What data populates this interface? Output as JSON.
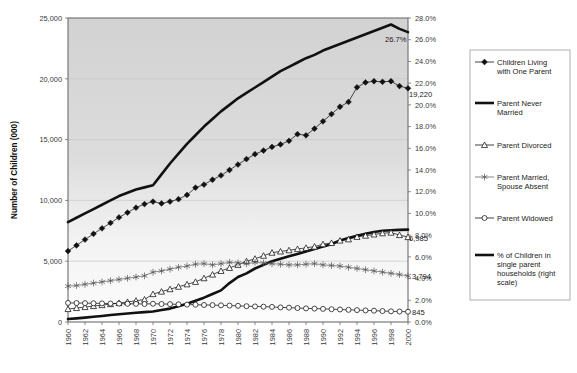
{
  "chart_data": {
    "type": "line",
    "title": "",
    "subtitle": "",
    "xlabel": "",
    "ylabel": "Number of Children (000)",
    "y2label": "",
    "grid": true,
    "legend_position": "right-outside",
    "xlim": [
      1960,
      2000
    ],
    "ylim": [
      0,
      25000
    ],
    "y2lim": [
      0,
      28
    ],
    "ytick_labels": [
      "25,000",
      "20,000",
      "15,000",
      "10,000",
      "5,000",
      "0"
    ],
    "ytick_values": [
      25000,
      20000,
      15000,
      10000,
      5000,
      0
    ],
    "y2tick_labels": [
      "28.0%",
      "26.0%",
      "24.0%",
      "22.0%",
      "20.0%",
      "18.0%",
      "16.0%",
      "14.0%",
      "12.0%",
      "10.0%",
      "8.0%",
      "6.0%",
      "4.0%",
      "2.0%",
      "0.0%"
    ],
    "y2tick_values": [
      28,
      26,
      24,
      22,
      20,
      18,
      16,
      14,
      12,
      10,
      8,
      6,
      4,
      2,
      0
    ],
    "xtick_labels": [
      "1960",
      "1962",
      "1964",
      "1966",
      "1968",
      "1970",
      "1972",
      "1974",
      "1976",
      "1978",
      "1980",
      "1982",
      "1984",
      "1986",
      "1988",
      "1990",
      "1992",
      "1994",
      "1996",
      "1998",
      "2000"
    ],
    "xtick_values": [
      1960,
      1962,
      1964,
      1966,
      1968,
      1970,
      1972,
      1974,
      1976,
      1978,
      1980,
      1982,
      1984,
      1986,
      1988,
      1990,
      1992,
      1994,
      1996,
      1998,
      2000
    ],
    "x": [
      1960,
      1961,
      1962,
      1963,
      1964,
      1965,
      1966,
      1967,
      1968,
      1969,
      1970,
      1971,
      1972,
      1973,
      1974,
      1975,
      1976,
      1977,
      1978,
      1979,
      1980,
      1981,
      1982,
      1983,
      1984,
      1985,
      1986,
      1987,
      1988,
      1989,
      1990,
      1991,
      1992,
      1993,
      1994,
      1995,
      1996,
      1997,
      1998,
      1999,
      2000
    ],
    "series": [
      {
        "name": "Children Living with One Parent",
        "axis": "left",
        "marker": "diamond-filled",
        "end_label": "19,220",
        "values": [
          5829,
          6300,
          6780,
          7250,
          7700,
          8150,
          8600,
          9000,
          9400,
          9700,
          9900,
          9750,
          9900,
          10100,
          10450,
          11050,
          11300,
          11700,
          12050,
          12500,
          12950,
          13400,
          13800,
          14100,
          14400,
          14600,
          14900,
          15450,
          15350,
          15900,
          16500,
          17100,
          17700,
          18100,
          19300,
          19700,
          19800,
          19750,
          19800,
          19400,
          19220
        ]
      },
      {
        "name": "Parent Never Married",
        "axis": "left",
        "marker": "none",
        "end_label": "",
        "values": [
          243,
          300,
          360,
          430,
          500,
          570,
          640,
          700,
          760,
          810,
          860,
          980,
          1100,
          1300,
          1500,
          1750,
          2000,
          2300,
          2600,
          3200,
          3700,
          4000,
          4400,
          4700,
          5000,
          5200,
          5400,
          5600,
          5800,
          6000,
          6200,
          6400,
          6700,
          6900,
          7100,
          7250,
          7400,
          7500,
          7550,
          7580,
          7597
        ]
      },
      {
        "name": "Parent Divorced",
        "axis": "left",
        "marker": "triangle-open",
        "end_label": "6,985",
        "values": [
          1066,
          1150,
          1230,
          1310,
          1390,
          1470,
          1560,
          1650,
          1750,
          1850,
          2296,
          2500,
          2700,
          2900,
          3100,
          3300,
          3600,
          3900,
          4200,
          4450,
          4700,
          5000,
          5200,
          5450,
          5700,
          5800,
          5900,
          6000,
          6100,
          6200,
          6400,
          6500,
          6700,
          6800,
          7000,
          7100,
          7200,
          7300,
          7350,
          7150,
          6985
        ]
      },
      {
        "name": "Parent Married, Spouse Absent",
        "axis": "left",
        "marker": "star-open",
        "end_label": "3,794",
        "values": [
          2951,
          3000,
          3100,
          3200,
          3300,
          3400,
          3500,
          3600,
          3700,
          3800,
          4100,
          4200,
          4350,
          4500,
          4600,
          4750,
          4800,
          4700,
          4800,
          4900,
          4850,
          4800,
          4900,
          4850,
          4800,
          4750,
          4700,
          4700,
          4750,
          4800,
          4700,
          4650,
          4600,
          4500,
          4400,
          4300,
          4200,
          4100,
          4000,
          3900,
          3794
        ]
      },
      {
        "name": "Parent Widowed",
        "axis": "left",
        "marker": "circle-open",
        "end_label": "845",
        "values": [
          1569,
          1560,
          1550,
          1540,
          1530,
          1520,
          1510,
          1500,
          1490,
          1480,
          1500,
          1480,
          1470,
          1450,
          1430,
          1420,
          1400,
          1390,
          1370,
          1350,
          1330,
          1300,
          1280,
          1260,
          1240,
          1200,
          1180,
          1150,
          1120,
          1100,
          1080,
          1050,
          1030,
          1000,
          980,
          950,
          930,
          900,
          880,
          860,
          845
        ]
      },
      {
        "name": "% of Children in single parent households (right scale)",
        "axis": "right",
        "marker": "none",
        "end_label": "26.7%",
        "values": [
          9.2,
          9.6,
          10.0,
          10.4,
          10.8,
          11.2,
          11.6,
          11.9,
          12.2,
          12.4,
          12.6,
          13.6,
          14.6,
          15.5,
          16.4,
          17.2,
          18.0,
          18.7,
          19.4,
          20.0,
          20.6,
          21.1,
          21.6,
          22.1,
          22.6,
          23.1,
          23.5,
          23.9,
          24.3,
          24.6,
          25.0,
          25.3,
          25.6,
          25.9,
          26.2,
          26.5,
          26.8,
          27.1,
          27.4,
          27.0,
          26.7
        ]
      }
    ],
    "data_labels": [
      {
        "text": "26.7%",
        "series": "% of Children in single parent households (right scale)"
      },
      {
        "text": "19,220",
        "series": "Children Living with One Parent"
      },
      {
        "text": "7,597",
        "series": "Parent Never Married"
      },
      {
        "text": "6,985",
        "series": "Parent Divorced"
      },
      {
        "text": "3,794",
        "series": "Parent Married, Spouse Absent"
      },
      {
        "text": "845",
        "series": "Parent Widowed"
      }
    ]
  },
  "legend": {
    "items": [
      {
        "label_line1": "Children Living",
        "label_line2": "with One Parent",
        "marker": "diamond-filled"
      },
      {
        "label_line1": "Parent Never",
        "label_line2": "Married",
        "marker": "thick-line"
      },
      {
        "label_line1": "Parent Divorced",
        "label_line2": "",
        "marker": "triangle-open"
      },
      {
        "label_line1": "Parent Married,",
        "label_line2": "Spouse Absent",
        "marker": "star-open"
      },
      {
        "label_line1": "Parent Widowed",
        "label_line2": "",
        "marker": "circle-open"
      },
      {
        "label_line1": "% of Children in",
        "label_line2": "single parent",
        "label_line3": "households (right",
        "label_line4": "scale)",
        "marker": "thick-line"
      }
    ]
  },
  "colors": {
    "line": "#111111",
    "grid": "#c9c9c9",
    "border": "#6e6e6e",
    "plot_bg_top": "#d0d0d0",
    "plot_bg_bottom": "#fdfdfd",
    "text": "#1a1a1a"
  }
}
